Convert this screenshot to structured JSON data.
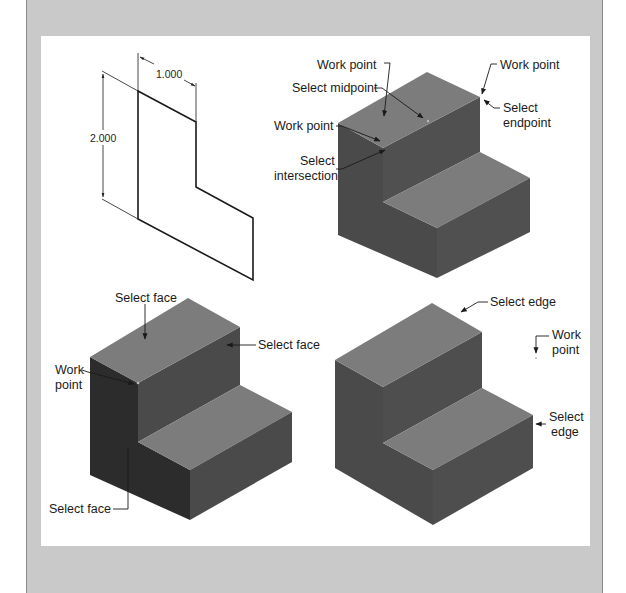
{
  "colors": {
    "frame_gray": "#c9c9c9",
    "panel_white": "#ffffff",
    "top_face": "#7c7c7c",
    "front_face": "#4c4c4c",
    "left_face": "#4a4a4a",
    "left_face_dark": "#2c2c2c",
    "line": "#1a1a1a"
  },
  "drawing_2d": {
    "dim_width_label": "1.000",
    "dim_height_label": "2.000",
    "profile": [
      [
        138,
        91
      ],
      [
        196,
        122
      ],
      [
        196,
        187
      ],
      [
        253,
        218
      ],
      [
        253,
        280
      ],
      [
        138,
        219
      ]
    ]
  },
  "views": [
    {
      "id": "top-right",
      "labels": [
        {
          "text": "Work point",
          "x": 317,
          "y": 58,
          "align": "left"
        },
        {
          "text": "Work point",
          "x": 498,
          "y": 64,
          "align": "left"
        },
        {
          "text": "Select midpoint",
          "x": 292,
          "y": 86,
          "align": "left"
        },
        {
          "text": "Select",
          "x": 503,
          "y": 105,
          "align": "left"
        },
        {
          "text": "endpoint",
          "x": 503,
          "y": 120,
          "align": "left"
        },
        {
          "text": "Work point",
          "x": 274,
          "y": 123,
          "align": "left"
        },
        {
          "text": "Select",
          "x": 300,
          "y": 155,
          "align": "left"
        },
        {
          "text": "intersection",
          "x": 274,
          "y": 170,
          "align": "left"
        }
      ]
    },
    {
      "id": "bottom-left",
      "labels": [
        {
          "text": "Select face",
          "x": 115,
          "y": 295,
          "align": "left"
        },
        {
          "text": "Select face",
          "x": 258,
          "y": 339,
          "align": "left"
        },
        {
          "text": "Work",
          "x": 54,
          "y": 363,
          "align": "left"
        },
        {
          "text": "point",
          "x": 54,
          "y": 378,
          "align": "left"
        },
        {
          "text": "Select face",
          "x": 49,
          "y": 502,
          "align": "left"
        }
      ]
    },
    {
      "id": "bottom-right",
      "labels": [
        {
          "text": "Select edge",
          "x": 490,
          "y": 295,
          "align": "left"
        },
        {
          "text": "Work",
          "x": 552,
          "y": 328,
          "align": "left"
        },
        {
          "text": "point",
          "x": 552,
          "y": 343,
          "align": "left"
        },
        {
          "text": "Select",
          "x": 548,
          "y": 410,
          "align": "left"
        },
        {
          "text": "edge",
          "x": 551,
          "y": 425,
          "align": "left"
        }
      ]
    }
  ]
}
